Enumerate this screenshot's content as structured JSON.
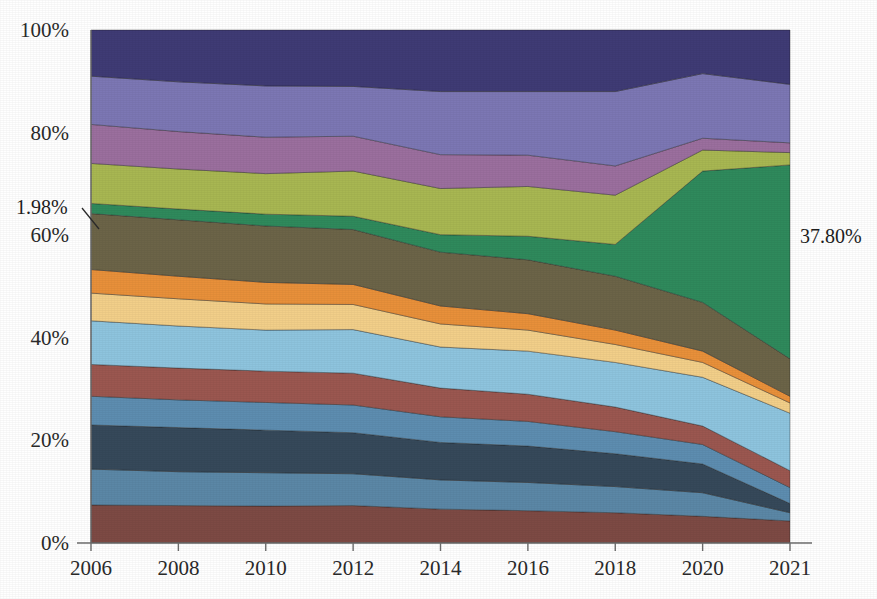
{
  "chart_data": {
    "type": "area",
    "title": "",
    "subtitle": "",
    "xlabel": "",
    "ylabel": "",
    "stacked": true,
    "normalized_percent": true,
    "grid": false,
    "legend_position": "none",
    "x": [
      2006,
      2008,
      2010,
      2012,
      2014,
      2016,
      2018,
      2020,
      2021
    ],
    "xtick_labels": [
      "2006",
      "2008",
      "2010",
      "2012",
      "2014",
      "2016",
      "2018",
      "2020",
      "2021"
    ],
    "ytick_labels": [
      "0%",
      "20%",
      "40%",
      "60%",
      "80%",
      "100%"
    ],
    "ytick_values": [
      0,
      20,
      40,
      60,
      80,
      100
    ],
    "ylim": [
      0,
      100
    ],
    "xlim": [
      2006,
      2021
    ],
    "series": [
      {
        "name": "series-01",
        "color": "#7d4a44",
        "values": [
          7.4,
          7.3,
          7.2,
          7.3,
          6.6,
          6.3,
          5.9,
          5.2,
          4.3
        ]
      },
      {
        "name": "series-02",
        "color": "#5b87a6",
        "values": [
          7.0,
          6.6,
          6.5,
          6.2,
          5.7,
          5.5,
          5.1,
          4.6,
          1.6
        ]
      },
      {
        "name": "series-03",
        "color": "#36495a",
        "values": [
          8.6,
          8.6,
          8.3,
          8.0,
          7.3,
          7.1,
          6.4,
          5.6,
          1.8
        ]
      },
      {
        "name": "series-04",
        "color": "#5d8db0",
        "values": [
          5.6,
          5.4,
          5.4,
          5.4,
          5.0,
          4.8,
          4.3,
          3.8,
          3.1
        ]
      },
      {
        "name": "series-05",
        "color": "#9b5750",
        "values": [
          6.2,
          6.2,
          6.1,
          6.2,
          5.6,
          5.3,
          4.8,
          3.6,
          3.3
        ]
      },
      {
        "name": "series-06",
        "color": "#8ec4de",
        "values": [
          8.5,
          8.2,
          8.0,
          8.5,
          8.0,
          8.4,
          8.7,
          9.5,
          11.2
        ]
      },
      {
        "name": "series-07",
        "color": "#f2cf89",
        "values": [
          5.4,
          5.3,
          5.1,
          4.9,
          4.5,
          4.1,
          3.5,
          2.9,
          2.0
        ]
      },
      {
        "name": "series-08",
        "color": "#e8903a",
        "values": [
          4.6,
          4.4,
          4.2,
          3.9,
          3.5,
          3.2,
          2.8,
          2.2,
          1.3
        ]
      },
      {
        "name": "series-09",
        "color": "#6c6448",
        "values": [
          10.9,
          11.0,
          11.0,
          10.7,
          10.5,
          10.5,
          10.5,
          9.5,
          7.3
        ]
      },
      {
        "name": "series-10",
        "color": "#2f8a5c",
        "values": [
          1.98,
          2.1,
          2.3,
          2.6,
          3.4,
          4.6,
          6.2,
          25.6,
          37.8
        ]
      },
      {
        "name": "series-11",
        "color": "#a8b752",
        "values": [
          7.8,
          7.8,
          7.9,
          8.8,
          9.0,
          9.7,
          9.6,
          4.1,
          2.4
        ]
      },
      {
        "name": "series-12",
        "color": "#9b6f9e",
        "values": [
          7.6,
          7.3,
          7.1,
          6.8,
          6.6,
          6.1,
          5.7,
          2.3,
          1.9
        ]
      },
      {
        "name": "series-13",
        "color": "#7c77b4",
        "values": [
          9.4,
          9.7,
          10.0,
          9.7,
          12.3,
          12.4,
          14.5,
          12.6,
          11.4
        ]
      },
      {
        "name": "series-14",
        "color": "#3f3b75",
        "values": [
          9.0,
          10.1,
          10.9,
          11.0,
          12.0,
          12.0,
          12.0,
          8.5,
          10.6
        ]
      }
    ],
    "annotations": [
      {
        "id": "annotation-left",
        "text": "1.98%",
        "series": "series-10",
        "side": "left",
        "value": 1.98,
        "label_x": 16,
        "label_y": 214,
        "leader_from_x": 82,
        "leader_from_y": 208,
        "leader_to_x": 99,
        "leader_to_y": 229
      },
      {
        "id": "annotation-right",
        "text": "37.80%",
        "series": "series-10",
        "side": "right",
        "value": 37.8,
        "label_x": 800,
        "label_y": 243
      }
    ]
  }
}
